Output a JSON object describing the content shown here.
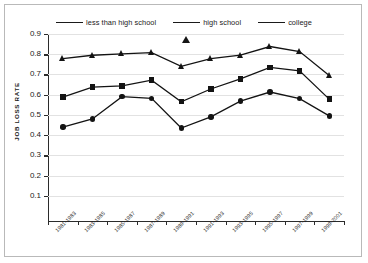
{
  "chart_data": {
    "type": "line",
    "title": "",
    "xlabel": "",
    "ylabel": "JOB LOSS RATE",
    "ylim": [
      0.0,
      0.9
    ],
    "yticks": [
      "0.1",
      "0.2",
      "0.3",
      "0.4",
      "0.5",
      "0.6",
      "0.7",
      "0.8",
      "0.9"
    ],
    "grid": true,
    "legend_position": "top-center",
    "categories": [
      "1981-1983",
      "1983-1985",
      "1985-1987",
      "1987-1989",
      "1989-1991",
      "1991-1993",
      "1993-1995",
      "1995-1997",
      "1997-1999",
      "1999-2001"
    ],
    "series": [
      {
        "name": "less than high school",
        "marker": "circle",
        "values": [
          0.44,
          0.48,
          0.59,
          0.582,
          0.435,
          0.49,
          0.568,
          0.613,
          0.58,
          0.495
        ]
      },
      {
        "name": "high school",
        "marker": "triangle",
        "values": [
          0.778,
          0.795,
          0.802,
          0.808,
          0.74,
          0.778,
          0.795,
          0.838,
          0.813,
          0.695
        ]
      },
      {
        "name": "college",
        "marker": "square",
        "values": [
          0.588,
          0.637,
          0.643,
          0.672,
          0.565,
          0.628,
          0.678,
          0.735,
          0.718,
          0.578
        ]
      }
    ]
  },
  "legend": {
    "items": [
      {
        "label": "less than high school",
        "marker": "circle"
      },
      {
        "label": "high school",
        "marker": "triangle"
      },
      {
        "label": "college",
        "marker": "square"
      }
    ]
  },
  "colors": {
    "series": "#131313",
    "grid": "#e2e2e2",
    "axis": "#2b2b2b",
    "frame": "#b9b9b9",
    "background": "#ffffff"
  }
}
